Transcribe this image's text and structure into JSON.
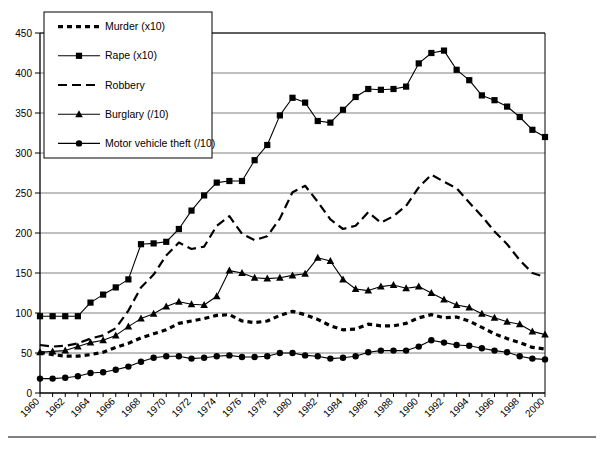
{
  "chart_data": {
    "type": "line",
    "title": "",
    "xlabel": "",
    "ylabel": "",
    "xlim": [
      1960,
      2000
    ],
    "ylim": [
      0,
      450
    ],
    "y_ticks": [
      0,
      50,
      100,
      150,
      200,
      250,
      300,
      350,
      400,
      450
    ],
    "x_ticks_labeled": [
      1960,
      1962,
      1964,
      1966,
      1968,
      1970,
      1972,
      1974,
      1976,
      1978,
      1980,
      1982,
      1984,
      1986,
      1988,
      1990,
      1992,
      1994,
      1996,
      1998,
      2000
    ],
    "x_tick_step": 1,
    "grid": "horizontal",
    "legend_position": "top-left",
    "x": [
      1960,
      1961,
      1962,
      1963,
      1964,
      1965,
      1966,
      1967,
      1968,
      1969,
      1970,
      1971,
      1972,
      1973,
      1974,
      1975,
      1976,
      1977,
      1978,
      1979,
      1980,
      1981,
      1982,
      1983,
      1984,
      1985,
      1986,
      1987,
      1988,
      1989,
      1990,
      1991,
      1992,
      1993,
      1994,
      1995,
      1996,
      1997,
      1998,
      1999,
      2000
    ],
    "series": [
      {
        "name": "Murder (x10)",
        "label": "Murder (x10)",
        "style": "dotted-dash",
        "marker": "none",
        "color": "#000000",
        "values": [
          51,
          48,
          46,
          46,
          48,
          51,
          57,
          62,
          69,
          74,
          79,
          87,
          90,
          93,
          97,
          98,
          90,
          88,
          90,
          97,
          102,
          98,
          92,
          84,
          79,
          80,
          86,
          84,
          84,
          87,
          94,
          98,
          94,
          95,
          90,
          82,
          74,
          68,
          63,
          57,
          55
        ]
      },
      {
        "name": "Rape (x10)",
        "label": "Rape (x10)",
        "style": "solid",
        "marker": "square",
        "color": "#000000",
        "values": [
          96,
          96,
          96,
          96,
          113,
          123,
          132,
          142,
          186,
          187,
          189,
          205,
          228,
          247,
          263,
          265,
          265,
          291,
          310,
          347,
          369,
          363,
          340,
          338,
          354,
          370,
          380,
          379,
          380,
          383,
          412,
          425,
          428,
          404,
          391,
          372,
          366,
          358,
          345,
          329,
          320
        ]
      },
      {
        "name": "Robbery",
        "label": "Robbery",
        "style": "dashed",
        "marker": "none",
        "color": "#000000",
        "values": [
          60,
          58,
          59,
          62,
          68,
          72,
          81,
          103,
          132,
          148,
          172,
          188,
          180,
          183,
          209,
          221,
          199,
          191,
          196,
          218,
          251,
          259,
          239,
          217,
          205,
          209,
          226,
          213,
          221,
          234,
          257,
          273,
          264,
          256,
          238,
          221,
          202,
          186,
          166,
          150,
          145
        ]
      },
      {
        "name": "Burglary (/10)",
        "label": "Burglary (/10)",
        "style": "solid",
        "marker": "triangle",
        "color": "#000000",
        "values": [
          51,
          52,
          53,
          58,
          63,
          66,
          72,
          83,
          93,
          99,
          108,
          114,
          111,
          110,
          121,
          153,
          150,
          144,
          143,
          144,
          147,
          149,
          169,
          165,
          142,
          130,
          128,
          133,
          135,
          131,
          133,
          125,
          117,
          110,
          107,
          99,
          94,
          89,
          86,
          77,
          73
        ]
      },
      {
        "name": "Motor vehicle theft (/10)",
        "label": "Motor vehicle theft (/10)",
        "style": "solid",
        "marker": "circle",
        "color": "#000000",
        "values": [
          18,
          18,
          19,
          21,
          25,
          26,
          29,
          33,
          39,
          44,
          46,
          46,
          43,
          44,
          46,
          47,
          45,
          45,
          46,
          50,
          50,
          47,
          46,
          43,
          44,
          46,
          51,
          53,
          53,
          53,
          58,
          66,
          63,
          60,
          59,
          56,
          53,
          51,
          46,
          43,
          42
        ]
      }
    ]
  },
  "legend": {
    "items": [
      {
        "label": "Murder (x10)",
        "marker": "none",
        "style": "dotted-dash"
      },
      {
        "label": "Rape (x10)",
        "marker": "square",
        "style": "solid"
      },
      {
        "label": "Robbery",
        "marker": "none",
        "style": "dashed"
      },
      {
        "label": "Burglary (/10)",
        "marker": "triangle",
        "style": "solid"
      },
      {
        "label": "Motor vehicle theft (/10)",
        "marker": "circle",
        "style": "solid"
      }
    ]
  },
  "colors": {
    "line": "#000000",
    "grid": "#808080",
    "axis": "#000000",
    "background": "#ffffff"
  }
}
